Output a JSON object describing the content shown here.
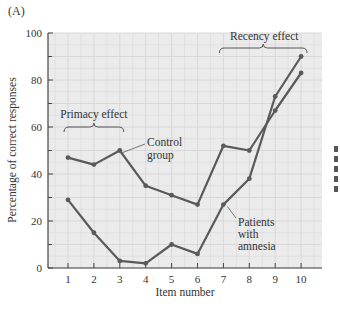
{
  "panel_label": "(A)",
  "chart_data": {
    "type": "line",
    "title": "",
    "xlabel": "Item number",
    "ylabel": "Percentage of correct responses",
    "x": [
      1,
      2,
      3,
      4,
      5,
      6,
      7,
      8,
      9,
      10
    ],
    "xticks": [
      "1",
      "2",
      "3",
      "4",
      "5",
      "6",
      "7",
      "8",
      "9",
      "10"
    ],
    "yticks": [
      "0",
      "20",
      "40",
      "60",
      "80",
      "100"
    ],
    "ylim": [
      0,
      100
    ],
    "grid": true,
    "series": [
      {
        "name": "Control group",
        "values": [
          47,
          44,
          50,
          35,
          31,
          27,
          52,
          50,
          67,
          83
        ]
      },
      {
        "name": "Patients with amnesia",
        "values": [
          29,
          15,
          3,
          2,
          10,
          6,
          27,
          38,
          73,
          90
        ]
      }
    ],
    "annotations": [
      {
        "text": "Primacy effect",
        "span": [
          1,
          3
        ]
      },
      {
        "text": "Recency effect",
        "span": [
          7,
          10
        ]
      },
      {
        "text": "Control group",
        "lines": [
          "Control",
          "group"
        ]
      },
      {
        "text": "Patients with amnesia",
        "lines": [
          "Patients",
          "with",
          "amnesia"
        ]
      }
    ],
    "colors": {
      "line": "#5a5a5a",
      "plot_bg": "#ebebeb",
      "grid": "#d6d6d6"
    }
  }
}
